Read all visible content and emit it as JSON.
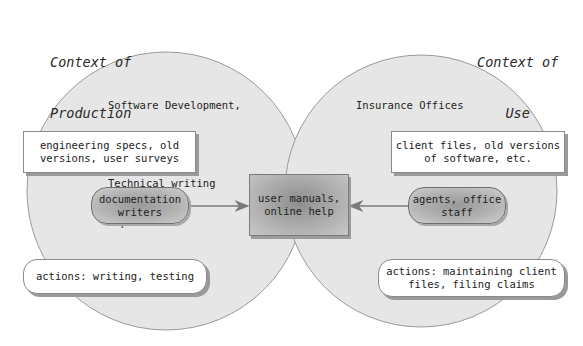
{
  "diagram": {
    "left_context": {
      "title_line1": "Context of",
      "title_line2": "Production",
      "organization": {
        "line1": "Software Development,",
        "line2": "Inc.:",
        "line3": "Technical writing",
        "line4": "department"
      },
      "resources": {
        "line1": "engineering specs, old",
        "line2": "versions, user surveys"
      },
      "agents": {
        "line1": "documentation",
        "line2": "writers"
      },
      "actions": {
        "line1": "actions: writing, testing"
      }
    },
    "right_context": {
      "title_line1": "Context of",
      "title_line2": "Use",
      "organization": {
        "line1": "Insurance Offices"
      },
      "resources": {
        "line1": "client files, old versions",
        "line2": "of software, etc."
      },
      "agents": {
        "line1": "agents, office",
        "line2": "staff"
      },
      "actions": {
        "line1": "actions: maintaining client",
        "line2": "files, filing claims"
      }
    },
    "center": {
      "line1": "user manuals,",
      "line2": "online help"
    },
    "colors": {
      "circle_fill": "#e6e6e6",
      "circle_stroke": "#9a9a9a",
      "arrow": "#7a7a7a"
    }
  }
}
